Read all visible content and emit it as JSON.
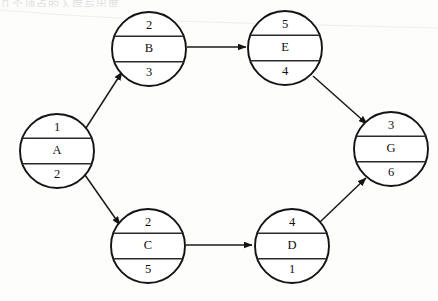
{
  "page": {
    "background_color": "#fdfdfc",
    "ink_color": "#141414",
    "top_edge_artifact": "几个顶点的入度与出度",
    "width": 438,
    "height": 301
  },
  "diagram": {
    "type": "directed-graph",
    "node_shape": "circle-three-row",
    "nodes": [
      {
        "id": "A",
        "label": "A",
        "top": "1",
        "bottom": "2",
        "cx": 57,
        "cy": 151,
        "r": 37
      },
      {
        "id": "B",
        "label": "B",
        "top": "2",
        "bottom": "3",
        "cx": 149,
        "cy": 49,
        "r": 37
      },
      {
        "id": "C",
        "label": "C",
        "top": "2",
        "bottom": "5",
        "cx": 148,
        "cy": 246,
        "r": 37
      },
      {
        "id": "D",
        "label": "D",
        "top": "4",
        "bottom": "1",
        "cx": 292,
        "cy": 246,
        "r": 37
      },
      {
        "id": "E",
        "label": "E",
        "top": "5",
        "bottom": "4",
        "cx": 285,
        "cy": 48,
        "r": 37
      },
      {
        "id": "G",
        "label": "G",
        "top": "3",
        "bottom": "6",
        "cx": 391,
        "cy": 149,
        "r": 37
      }
    ],
    "edges": [
      {
        "from": "A",
        "to": "B",
        "x1": 86,
        "y1": 128,
        "x2": 122,
        "y2": 72
      },
      {
        "from": "A",
        "to": "C",
        "x1": 85,
        "y1": 175,
        "x2": 120,
        "y2": 225
      },
      {
        "from": "B",
        "to": "E",
        "x1": 187,
        "y1": 47,
        "x2": 246,
        "y2": 47
      },
      {
        "from": "C",
        "to": "D",
        "x1": 186,
        "y1": 245,
        "x2": 252,
        "y2": 245
      },
      {
        "from": "E",
        "to": "G",
        "x1": 313,
        "y1": 76,
        "x2": 367,
        "y2": 124
      },
      {
        "from": "D",
        "to": "G",
        "x1": 320,
        "y1": 222,
        "x2": 366,
        "y2": 178
      }
    ]
  }
}
